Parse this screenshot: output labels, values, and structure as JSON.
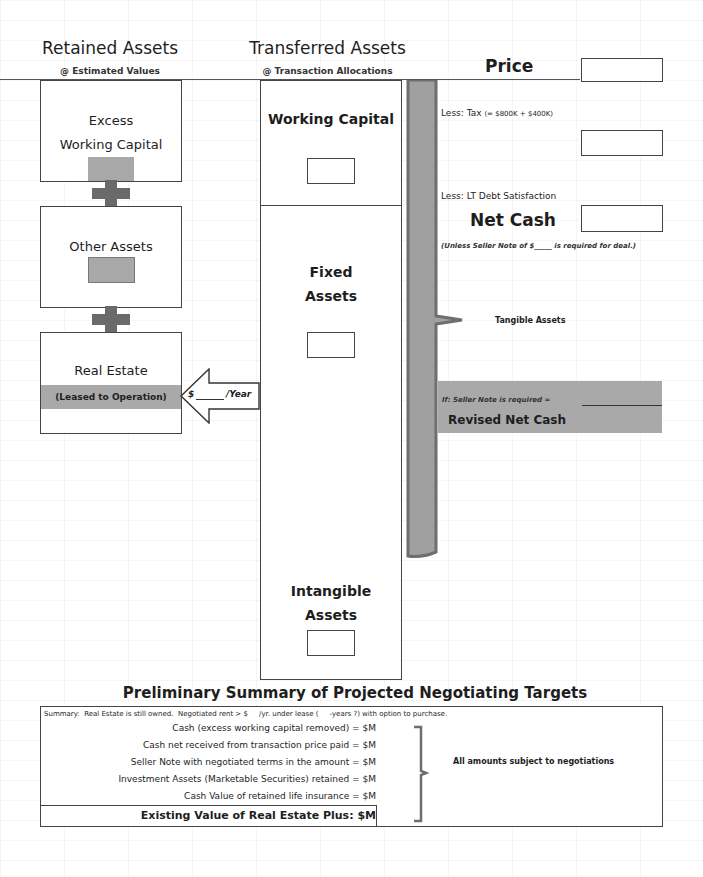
{
  "retained": {
    "title": "Retained Assets",
    "subtitle": "@ Estimated Values",
    "excess_wc": {
      "line1": "Excess",
      "line2": "Working Capital"
    },
    "other_assets": {
      "label": "Other Assets"
    },
    "real_estate": {
      "label": "Real Estate",
      "leased": "(Leased to Operation)"
    }
  },
  "transferred": {
    "title": "Transferred Assets",
    "subtitle": "@ Transaction Allocations",
    "working_capital": {
      "label": "Working Capital"
    },
    "fixed_assets": {
      "line1": "Fixed",
      "line2": "Assets"
    },
    "intangible_assets": {
      "line1": "Intangible",
      "line2": "Assets"
    }
  },
  "lease_arrow": {
    "dollar": "$",
    "per_year": "/Year"
  },
  "right": {
    "price_label": "Price",
    "less_tax": "Less:  Tax",
    "tax_formula": "(= $800K + $400K)",
    "less_debt": "Less: LT Debt Satisfaction",
    "net_cash": "Net Cash",
    "unless_note": "(Unless Seller Note of $_____ is required for deal.)",
    "tangible_assets": "Tangible Assets",
    "if_seller_note": "If:  Seller Note is required =",
    "revised_net_cash": "Revised Net Cash"
  },
  "summary": {
    "title": "Preliminary Summary of Projected Negotiating Targets",
    "intro": "Summary:  Real Estate is still owned.  Negotiated rent > $     /yr. under lease (     -years ?) with option to purchase.",
    "lines": [
      "Cash (excess working capital removed) = $M",
      "Cash net received from transaction price paid = $M",
      "Seller Note with negotiated terms in the amount = $M",
      "Investment Assets (Marketable Securities) retained = $M",
      "Cash Value of retained life insurance = $M"
    ],
    "total": "Existing Value of Real Estate Plus:   $M",
    "note": "All amounts subject to negotiations"
  },
  "colors": {
    "gray_fill": "#a8a8a8",
    "plus": "#6a6a6a",
    "brace": "#a0a0a0",
    "brace_shadow": "#6e6e6e",
    "band": "#a9a9a9"
  }
}
